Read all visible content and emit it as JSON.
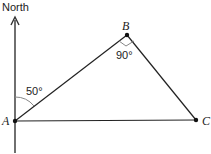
{
  "diagram": {
    "north_label": "North",
    "points": {
      "A": {
        "label": "A",
        "x": 15,
        "y": 121
      },
      "B": {
        "label": "B",
        "x": 127,
        "y": 35
      },
      "C": {
        "label": "C",
        "x": 196,
        "y": 120
      }
    },
    "angles": {
      "bearing_label": "50°",
      "right_angle_label": "90°"
    },
    "colors": {
      "line": "#222222",
      "arc": "#888888",
      "background": "#ffffff"
    }
  }
}
